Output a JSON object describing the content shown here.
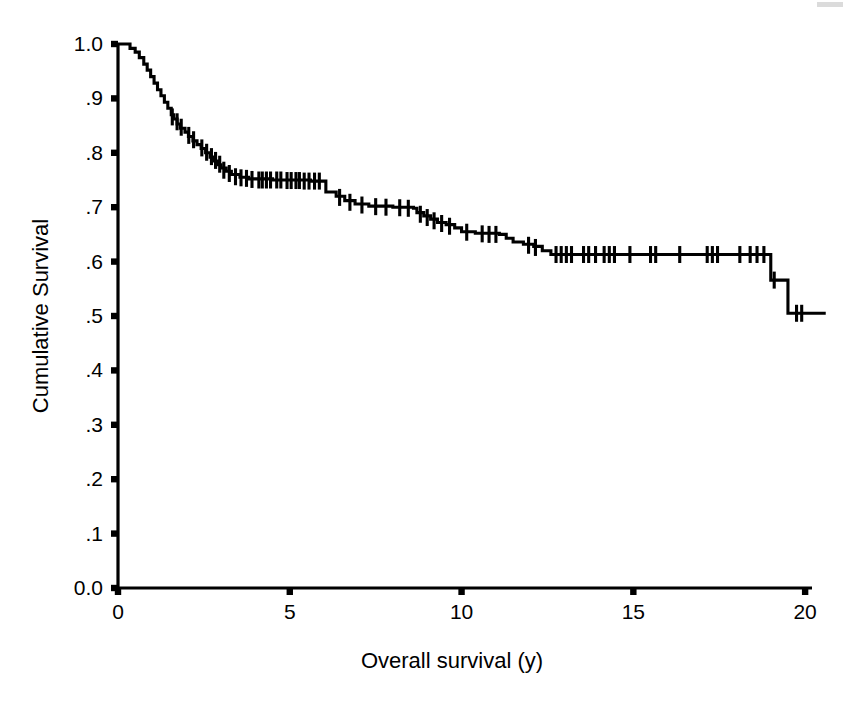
{
  "figure": {
    "kind": "kaplan-meier-survival-plot",
    "background_color": "#ffffff",
    "line_color": "#000000"
  },
  "axes": {
    "y_title": "Cumulative Survival",
    "x_title": "Overall survival (y)",
    "y_ticks": [
      "0.0",
      ".1",
      ".2",
      ".3",
      ".4",
      ".5",
      ".6",
      ".7",
      ".8",
      ".9",
      "1.0"
    ],
    "x_ticks": [
      "0",
      "5",
      "10",
      "15",
      "20"
    ]
  },
  "chart_data": {
    "type": "line",
    "title": "",
    "subtitle": "",
    "xlabel": "Overall survival (y)",
    "ylabel": "Cumulative Survival",
    "xlim": [
      0,
      20
    ],
    "ylim": [
      0.0,
      1.0
    ],
    "xticks": [
      0,
      5,
      10,
      15,
      20
    ],
    "yticks": [
      0.0,
      0.1,
      0.2,
      0.3,
      0.4,
      0.5,
      0.6,
      0.7,
      0.8,
      0.9,
      1.0
    ],
    "grid": false,
    "legend": "none",
    "curve_style": "step-post",
    "series": [
      {
        "name": "Overall survival",
        "step_points": [
          [
            0.0,
            1.0
          ],
          [
            0.25,
            1.0
          ],
          [
            0.35,
            0.992
          ],
          [
            0.5,
            0.985
          ],
          [
            0.62,
            0.975
          ],
          [
            0.75,
            0.963
          ],
          [
            0.85,
            0.952
          ],
          [
            0.95,
            0.94
          ],
          [
            1.05,
            0.928
          ],
          [
            1.15,
            0.916
          ],
          [
            1.25,
            0.905
          ],
          [
            1.35,
            0.893
          ],
          [
            1.45,
            0.882
          ],
          [
            1.55,
            0.87
          ],
          [
            1.62,
            0.862
          ],
          [
            1.72,
            0.853
          ],
          [
            1.82,
            0.845
          ],
          [
            1.95,
            0.838
          ],
          [
            2.05,
            0.83
          ],
          [
            2.18,
            0.822
          ],
          [
            2.3,
            0.815
          ],
          [
            2.42,
            0.808
          ],
          [
            2.55,
            0.8
          ],
          [
            2.68,
            0.792
          ],
          [
            2.8,
            0.785
          ],
          [
            2.9,
            0.778
          ],
          [
            3.0,
            0.772
          ],
          [
            3.15,
            0.766
          ],
          [
            3.3,
            0.76
          ],
          [
            3.55,
            0.755
          ],
          [
            3.8,
            0.752
          ],
          [
            4.5,
            0.75
          ],
          [
            5.6,
            0.748
          ],
          [
            6.0,
            0.748
          ],
          [
            6.05,
            0.728
          ],
          [
            6.35,
            0.72
          ],
          [
            6.6,
            0.712
          ],
          [
            6.9,
            0.706
          ],
          [
            7.3,
            0.702
          ],
          [
            8.0,
            0.7
          ],
          [
            8.6,
            0.698
          ],
          [
            8.7,
            0.69
          ],
          [
            8.9,
            0.684
          ],
          [
            9.1,
            0.678
          ],
          [
            9.3,
            0.672
          ],
          [
            9.55,
            0.668
          ],
          [
            9.8,
            0.662
          ],
          [
            10.0,
            0.655
          ],
          [
            10.4,
            0.652
          ],
          [
            11.1,
            0.65
          ],
          [
            11.3,
            0.643
          ],
          [
            11.5,
            0.636
          ],
          [
            11.8,
            0.632
          ],
          [
            12.1,
            0.628
          ],
          [
            12.35,
            0.62
          ],
          [
            12.6,
            0.613
          ],
          [
            18.9,
            0.613
          ],
          [
            19.0,
            0.566
          ],
          [
            19.45,
            0.566
          ],
          [
            19.5,
            0.505
          ],
          [
            20.6,
            0.505
          ]
        ],
        "censor_marks": [
          [
            1.58,
            0.866
          ],
          [
            1.72,
            0.857
          ],
          [
            1.84,
            0.847
          ],
          [
            2.06,
            0.832
          ],
          [
            2.2,
            0.824
          ],
          [
            2.44,
            0.809
          ],
          [
            2.58,
            0.801
          ],
          [
            2.72,
            0.793
          ],
          [
            2.84,
            0.786
          ],
          [
            2.96,
            0.779
          ],
          [
            3.08,
            0.768
          ],
          [
            3.24,
            0.762
          ],
          [
            3.42,
            0.756
          ],
          [
            3.58,
            0.754
          ],
          [
            3.74,
            0.753
          ],
          [
            3.9,
            0.751
          ],
          [
            4.1,
            0.75
          ],
          [
            4.2,
            0.75
          ],
          [
            4.32,
            0.75
          ],
          [
            4.44,
            0.75
          ],
          [
            4.62,
            0.75
          ],
          [
            4.74,
            0.75
          ],
          [
            4.92,
            0.749
          ],
          [
            5.04,
            0.749
          ],
          [
            5.18,
            0.749
          ],
          [
            5.28,
            0.749
          ],
          [
            5.42,
            0.748
          ],
          [
            5.56,
            0.748
          ],
          [
            5.72,
            0.748
          ],
          [
            5.86,
            0.748
          ],
          [
            6.45,
            0.718
          ],
          [
            6.75,
            0.709
          ],
          [
            7.1,
            0.704
          ],
          [
            7.5,
            0.701
          ],
          [
            7.8,
            0.7
          ],
          [
            8.2,
            0.699
          ],
          [
            8.45,
            0.698
          ],
          [
            8.8,
            0.687
          ],
          [
            9.0,
            0.681
          ],
          [
            9.2,
            0.675
          ],
          [
            9.42,
            0.67
          ],
          [
            9.65,
            0.665
          ],
          [
            10.15,
            0.654
          ],
          [
            10.6,
            0.651
          ],
          [
            10.8,
            0.65
          ],
          [
            11.0,
            0.65
          ],
          [
            11.95,
            0.63
          ],
          [
            12.15,
            0.626
          ],
          [
            12.75,
            0.613
          ],
          [
            12.9,
            0.613
          ],
          [
            13.05,
            0.613
          ],
          [
            13.2,
            0.613
          ],
          [
            13.55,
            0.613
          ],
          [
            13.7,
            0.613
          ],
          [
            13.9,
            0.613
          ],
          [
            14.15,
            0.613
          ],
          [
            14.3,
            0.613
          ],
          [
            14.45,
            0.613
          ],
          [
            14.9,
            0.613
          ],
          [
            15.5,
            0.613
          ],
          [
            15.65,
            0.613
          ],
          [
            16.35,
            0.613
          ],
          [
            17.15,
            0.613
          ],
          [
            17.3,
            0.613
          ],
          [
            17.45,
            0.613
          ],
          [
            18.1,
            0.613
          ],
          [
            18.4,
            0.613
          ],
          [
            18.6,
            0.613
          ],
          [
            18.8,
            0.613
          ],
          [
            19.1,
            0.566
          ],
          [
            19.75,
            0.505
          ],
          [
            19.9,
            0.505
          ]
        ]
      }
    ]
  }
}
